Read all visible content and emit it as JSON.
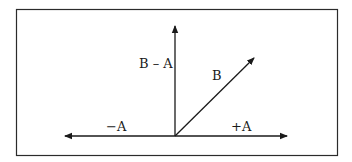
{
  "diagram": {
    "type": "vector-diagram",
    "frame": {
      "x1": 16,
      "y1": 9,
      "x2": 337,
      "y2": 155,
      "stroke": "#2b2b2b"
    },
    "origin": {
      "x": 175,
      "y": 136
    },
    "stroke_color": "#1a1a1a",
    "vectors": [
      {
        "id": "b-minus-a",
        "label": "B – A",
        "tip": {
          "x": 175,
          "y": 26
        },
        "label_pos": {
          "x": 139,
          "y": 68
        }
      },
      {
        "id": "b",
        "label": "B",
        "tip": {
          "x": 254,
          "y": 58
        },
        "label_pos": {
          "x": 212,
          "y": 80
        }
      },
      {
        "id": "minus-a",
        "label": "−A",
        "tip": {
          "x": 65,
          "y": 136
        },
        "label_pos": {
          "x": 106,
          "y": 131
        }
      },
      {
        "id": "plus-a",
        "label": "+A",
        "tip": {
          "x": 287,
          "y": 136
        },
        "label_pos": {
          "x": 231,
          "y": 131
        }
      }
    ]
  }
}
